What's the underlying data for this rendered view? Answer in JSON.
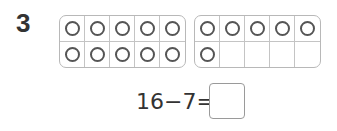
{
  "question": {
    "number": "3",
    "ten_frames": [
      {
        "filled": [
          true,
          true,
          true,
          true,
          true,
          true,
          true,
          true,
          true,
          true
        ]
      },
      {
        "filled": [
          true,
          true,
          true,
          true,
          true,
          true,
          false,
          false,
          false,
          false
        ]
      }
    ],
    "equation": {
      "minuend": "16",
      "operator": "−",
      "subtrahend": "7",
      "equals": "=",
      "answer": ""
    }
  }
}
